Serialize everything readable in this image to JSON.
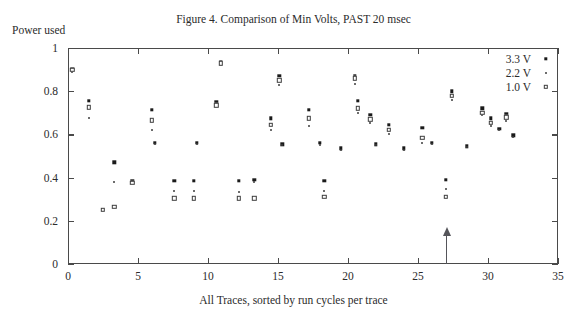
{
  "figure": {
    "title": "Figure 4. Comparison of Min Volts, PAST 20 msec",
    "y_axis_caption": "Power used",
    "x_axis_caption": "All Traces, sorted by run cycles per trace"
  },
  "legend": {
    "position": "top-right",
    "entries": [
      {
        "label": "3.3 V",
        "marker": "filled-square-dot"
      },
      {
        "label": "2.2 V",
        "marker": "small-dot"
      },
      {
        "label": "1.0 V",
        "marker": "open-square"
      }
    ]
  },
  "annotation": {
    "type": "up-arrow",
    "x": 27,
    "label": ""
  },
  "chart_data": {
    "type": "scatter",
    "title": "Figure 4. Comparison of Min Volts, PAST 20 msec",
    "xlabel": "All Traces, sorted by run cycles per trace",
    "ylabel": "Power used",
    "xlim": [
      0,
      35
    ],
    "ylim": [
      0,
      1
    ],
    "xticks": [
      0,
      5,
      10,
      15,
      20,
      25,
      30,
      35
    ],
    "yticks": [
      0,
      0.2,
      0.4,
      0.6,
      0.8,
      1
    ],
    "xtick_labels": [
      "0",
      "5",
      "10",
      "15",
      "20",
      "25",
      "30",
      "35"
    ],
    "ytick_labels": [
      "0",
      "0.2",
      "0.4",
      "0.6",
      "0.8",
      "1"
    ],
    "grid": false,
    "legend_position": "upper right",
    "annotations": [
      {
        "type": "arrow",
        "x": 27,
        "y_from": 0,
        "y_to": 0.13,
        "direction": "up"
      }
    ],
    "series": [
      {
        "name": "3.3 V",
        "marker": "filled-square-dot",
        "points": [
          [
            0.3,
            0.905
          ],
          [
            1.5,
            0.755
          ],
          [
            3.3,
            0.47
          ],
          [
            4.6,
            0.385
          ],
          [
            6.0,
            0.715
          ],
          [
            6.2,
            0.56
          ],
          [
            7.6,
            0.385
          ],
          [
            9.0,
            0.385
          ],
          [
            9.2,
            0.56
          ],
          [
            10.6,
            0.75
          ],
          [
            10.9,
            0.935
          ],
          [
            12.2,
            0.385
          ],
          [
            13.3,
            0.39
          ],
          [
            14.5,
            0.675
          ],
          [
            15.1,
            0.87
          ],
          [
            15.3,
            0.555
          ],
          [
            17.2,
            0.715
          ],
          [
            18.0,
            0.56
          ],
          [
            18.3,
            0.385
          ],
          [
            19.5,
            0.535
          ],
          [
            20.5,
            0.87
          ],
          [
            20.7,
            0.755
          ],
          [
            21.6,
            0.69
          ],
          [
            22.0,
            0.555
          ],
          [
            22.9,
            0.645
          ],
          [
            24.0,
            0.535
          ],
          [
            25.3,
            0.63
          ],
          [
            26.0,
            0.56
          ],
          [
            27.0,
            0.39
          ],
          [
            27.4,
            0.8
          ],
          [
            28.5,
            0.545
          ],
          [
            29.6,
            0.72
          ],
          [
            30.2,
            0.675
          ],
          [
            30.8,
            0.625
          ],
          [
            31.3,
            0.695
          ],
          [
            31.8,
            0.595
          ]
        ]
      },
      {
        "name": "2.2 V",
        "marker": "small-dot",
        "points": [
          [
            0.3,
            0.89
          ],
          [
            1.5,
            0.675
          ],
          [
            3.3,
            0.38
          ],
          [
            4.6,
            0.38
          ],
          [
            6.0,
            0.62
          ],
          [
            6.2,
            0.555
          ],
          [
            7.6,
            0.34
          ],
          [
            9.0,
            0.34
          ],
          [
            9.2,
            0.555
          ],
          [
            10.6,
            0.725
          ],
          [
            10.9,
            0.92
          ],
          [
            12.2,
            0.335
          ],
          [
            13.3,
            0.38
          ],
          [
            14.5,
            0.62
          ],
          [
            15.1,
            0.83
          ],
          [
            15.3,
            0.55
          ],
          [
            17.2,
            0.64
          ],
          [
            18.0,
            0.55
          ],
          [
            18.3,
            0.34
          ],
          [
            19.5,
            0.53
          ],
          [
            20.5,
            0.835
          ],
          [
            20.7,
            0.7
          ],
          [
            21.6,
            0.655
          ],
          [
            22.0,
            0.55
          ],
          [
            22.9,
            0.6
          ],
          [
            24.0,
            0.53
          ],
          [
            25.3,
            0.56
          ],
          [
            26.0,
            0.555
          ],
          [
            27.0,
            0.345
          ],
          [
            27.4,
            0.76
          ],
          [
            28.5,
            0.54
          ],
          [
            29.6,
            0.69
          ],
          [
            30.2,
            0.64
          ],
          [
            30.8,
            0.62
          ],
          [
            31.3,
            0.66
          ],
          [
            31.8,
            0.59
          ]
        ]
      },
      {
        "name": "1.0 V",
        "marker": "open-square",
        "points": [
          [
            0.3,
            0.9
          ],
          [
            1.5,
            0.725
          ],
          [
            2.5,
            0.25
          ],
          [
            3.3,
            0.265
          ],
          [
            4.6,
            0.375
          ],
          [
            6.0,
            0.665
          ],
          [
            7.6,
            0.305
          ],
          [
            9.0,
            0.305
          ],
          [
            10.6,
            0.735
          ],
          [
            10.9,
            0.93
          ],
          [
            12.2,
            0.305
          ],
          [
            13.3,
            0.305
          ],
          [
            14.5,
            0.645
          ],
          [
            15.1,
            0.85
          ],
          [
            17.2,
            0.675
          ],
          [
            18.3,
            0.31
          ],
          [
            20.5,
            0.86
          ],
          [
            20.7,
            0.72
          ],
          [
            21.6,
            0.67
          ],
          [
            22.9,
            0.62
          ],
          [
            25.3,
            0.585
          ],
          [
            27.0,
            0.31
          ],
          [
            27.4,
            0.78
          ],
          [
            29.6,
            0.7
          ],
          [
            30.2,
            0.655
          ],
          [
            31.3,
            0.68
          ]
        ]
      }
    ]
  }
}
